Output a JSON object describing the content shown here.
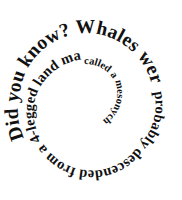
{
  "graphic": {
    "kind": "spiral-text-typography",
    "full_text": "Did you know? Whales were probably descended from a 4-legged land mammal called a mesonychid.",
    "background_color": "#ffffff",
    "text_color": "#111111",
    "direction": "inward-clockwise-spiral",
    "segments": [
      {
        "id": "seg1",
        "text": "Did you know? Whales were"
      },
      {
        "id": "seg2",
        "text": "probably descended from a 4-legged land mammal"
      },
      {
        "id": "seg3",
        "text": "called a mesonychid."
      }
    ],
    "segment_text": {
      "seg1": "Did you know? Whales were",
      "seg2": "probably descended from a 4-legged land mammal",
      "seg3": "called a mesonychid."
    },
    "center": {
      "x": 88,
      "y": 101
    },
    "canvas": {
      "width": 182,
      "height": 200
    }
  }
}
